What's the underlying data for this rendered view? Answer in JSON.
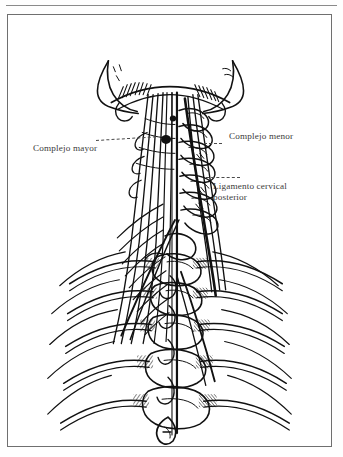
{
  "figure": {
    "type": "anatomical-illustration",
    "background_color": "#ffffff",
    "ink_color": "#1a1a1a",
    "frame_color": "#6f6f6f",
    "text_color": "#3b3b3b"
  },
  "labels": {
    "complejo_mayor": "Complejo mayor",
    "complejo_menor": "Complejo menor",
    "ligamento_line1": "Ligamento cervical",
    "ligamento_line2": "posterior"
  },
  "structures": [
    "occipital-bone",
    "mastoid-process-left",
    "mastoid-process-right",
    "cervical-vertebrae",
    "thoracic-vertebrae",
    "ribs-left",
    "ribs-right",
    "semispinalis-capitis-fibers",
    "nuchal-ligament"
  ]
}
